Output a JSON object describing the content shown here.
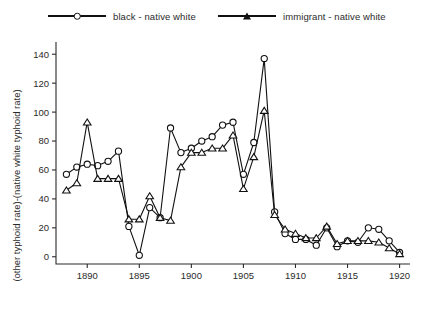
{
  "chart_data": {
    "type": "line",
    "title": "",
    "xlabel": "year",
    "ylabel": "(other typhoid rate)-(native white typhoid rate)",
    "xlim": [
      1887,
      1921
    ],
    "ylim": [
      -5,
      145
    ],
    "xticks": [
      1890,
      1895,
      1900,
      1905,
      1910,
      1915,
      1920
    ],
    "yticks": [
      0,
      20,
      40,
      60,
      80,
      100,
      120,
      140
    ],
    "grid": false,
    "legend_position": "top",
    "series": [
      {
        "name": "black - native white",
        "marker": "circle",
        "x": [
          1888,
          1889,
          1890,
          1891,
          1892,
          1893,
          1894,
          1895,
          1896,
          1897,
          1898,
          1899,
          1900,
          1901,
          1902,
          1903,
          1904,
          1905,
          1906,
          1907,
          1908,
          1909,
          1910,
          1911,
          1912,
          1913,
          1914,
          1915,
          1916,
          1917,
          1918,
          1919,
          1920
        ],
        "y": [
          57,
          62,
          64,
          63,
          66,
          73,
          21,
          1,
          34,
          27,
          89,
          72,
          75,
          80,
          83,
          91,
          93,
          57,
          79,
          137,
          31,
          16,
          12,
          12,
          8,
          20,
          7,
          11,
          10,
          20,
          19,
          11,
          3
        ]
      },
      {
        "name": "immigrant - native white",
        "marker": "triangle",
        "x": [
          1888,
          1889,
          1890,
          1891,
          1892,
          1893,
          1894,
          1895,
          1896,
          1897,
          1898,
          1899,
          1900,
          1901,
          1902,
          1903,
          1904,
          1905,
          1906,
          1907,
          1908,
          1909,
          1910,
          1911,
          1912,
          1913,
          1914,
          1915,
          1916,
          1917,
          1918,
          1919,
          1920
        ],
        "y": [
          46,
          51,
          93,
          54,
          54,
          54,
          26,
          26,
          42,
          27,
          25,
          62,
          72,
          72,
          75,
          75,
          84,
          47,
          69,
          101,
          29,
          19,
          16,
          13,
          13,
          21,
          9,
          11,
          11,
          11,
          10,
          6,
          2
        ]
      }
    ]
  },
  "legend": {
    "entries": [
      {
        "label": "black - native white",
        "marker": "circle"
      },
      {
        "label": "immigrant - native white",
        "marker": "triangle"
      }
    ]
  }
}
